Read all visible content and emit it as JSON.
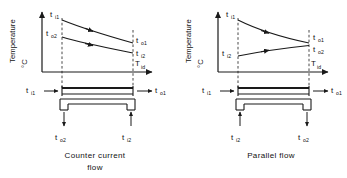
{
  "figure": {
    "background": "#ffffff",
    "ink": "#1a1a1a",
    "panels": [
      {
        "id": "counter-current",
        "caption_line1": "Counter current",
        "caption_line2": "flow",
        "axes": {
          "ylabel_main": "Temperature",
          "ylabel_unit": "°C",
          "xlabel": "T",
          "xlabel_sub": "id"
        },
        "curve_labels": {
          "top_left": {
            "base": "t",
            "sub": "i1"
          },
          "bottom_left": {
            "base": "t",
            "sub": "o2"
          },
          "top_right": {
            "base": "t",
            "sub": "o1"
          },
          "bottom_right": {
            "base": "t",
            "sub": "i2"
          }
        },
        "exchanger_labels": {
          "inlet_left": {
            "base": "t",
            "sub": "i1"
          },
          "outlet_right": {
            "base": "t",
            "sub": "o1"
          },
          "bottom_left": {
            "base": "t",
            "sub": "o2"
          },
          "bottom_right": {
            "base": "t",
            "sub": "i2"
          }
        },
        "flow_directions": {
          "hot_stream": "left-to-right",
          "cold_stream": "right-to-left",
          "bottom_left_arrow": "out",
          "bottom_right_arrow": "in"
        },
        "curve_shape": "both curves descend left to right"
      },
      {
        "id": "parallel",
        "caption_line1": "Parallel flow",
        "caption_line2": "",
        "axes": {
          "ylabel_main": "Temperature",
          "ylabel_unit": "°C",
          "xlabel": "T",
          "xlabel_sub": "id"
        },
        "curve_labels": {
          "top_left": {
            "base": "t",
            "sub": "i1"
          },
          "bottom_left": {
            "base": "t",
            "sub": "i2"
          },
          "top_right": {
            "base": "t",
            "sub": "o1"
          },
          "bottom_right": {
            "base": "t",
            "sub": "o2"
          }
        },
        "exchanger_labels": {
          "inlet_left": {
            "base": "t",
            "sub": "i1"
          },
          "outlet_right": {
            "base": "t",
            "sub": "o1"
          },
          "bottom_left": {
            "base": "t",
            "sub": "i2"
          },
          "bottom_right": {
            "base": "t",
            "sub": "o2"
          }
        },
        "flow_directions": {
          "hot_stream": "left-to-right",
          "cold_stream": "left-to-right",
          "bottom_left_arrow": "in",
          "bottom_right_arrow": "out"
        },
        "curve_shape": "curves converge: upper descends, lower ascends"
      }
    ]
  }
}
